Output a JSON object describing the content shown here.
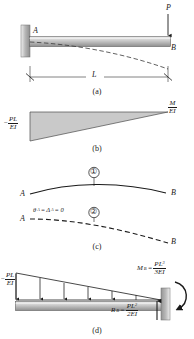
{
  "figure": {
    "type": "engineering-beam-diagram",
    "colors": {
      "line": "#1a1a1a",
      "beam_fill_light": "#d8d8d8",
      "beam_fill_dark": "#9a9a9a",
      "diagram_fill": "#c9c9c9",
      "wall_fill": "#b0b0b0",
      "background": "#ffffff"
    }
  },
  "panel_a": {
    "caption": "(a)",
    "point_a_label": "A",
    "point_b_label": "B",
    "load_label": "P",
    "span_label": "L",
    "notes": "Cantilever fixed at A (left wall), free end B at right with downward point load P; dashed curve shows deflected shape"
  },
  "panel_b": {
    "caption": "(b)",
    "left_value": {
      "sign": "−",
      "numerator": "PL",
      "denominator": "EI"
    },
    "right_value": {
      "numerator": "M",
      "denominator": "EI"
    },
    "notes": "Triangular M/EI diagram, maximum magnitude PL/EI at left (fixed end), zero at right"
  },
  "panel_c": {
    "caption": "(c)",
    "curve1": {
      "marker": "①",
      "left_label": "A",
      "right_label": "B"
    },
    "curve2": {
      "marker": "②",
      "left_label": "A",
      "right_label": "B"
    },
    "boundary_condition": "θ",
    "boundary_condition_full": "θₐ = Δₐ = 0",
    "bc_theta": "θ",
    "bc_sub_a": "A",
    "bc_eq1": "=",
    "bc_delta": "Δ",
    "bc_eq2": "= 0"
  },
  "panel_d": {
    "caption": "(d)",
    "left_value": {
      "sign": "−",
      "numerator": "PL",
      "denominator": "EI"
    },
    "moment_reaction": {
      "symbol": "M",
      "subscript": "B",
      "equals": "=",
      "numerator": "PL",
      "numerator_exponent": "3",
      "denominator": "3EI"
    },
    "shear_reaction": {
      "symbol": "R",
      "subscript": "B",
      "equals": "=",
      "numerator": "PL",
      "numerator_exponent": "2",
      "denominator": "2EI"
    },
    "notes": "Conjugate beam: triangular distributed elastic load with arrows, fixed support at right end B, reactions M_B and R_B"
  }
}
